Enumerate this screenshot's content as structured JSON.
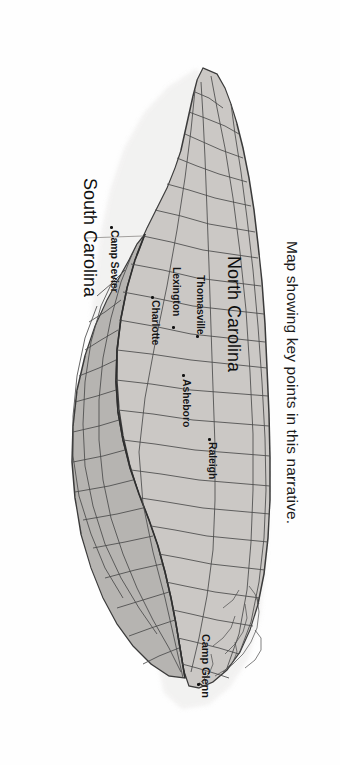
{
  "figure": {
    "caption": "Map showing key points in this narrative.",
    "orientation": "rotated-90-clockwise",
    "background_color": "#ffffff"
  },
  "map": {
    "title": "Map showing key points in this narrative.",
    "states": [
      {
        "name": "North Carolina",
        "label": "North Carolina",
        "fill_color": "#cbc8c5",
        "border_color": "#3a3a3a"
      },
      {
        "name": "South Carolina",
        "label": "South Carolina",
        "fill_color": "#b6b4b1",
        "border_color": "#3a3a3a"
      }
    ],
    "county_line_color": "#4a4a4a",
    "points": [
      {
        "label": "Camp Glenn",
        "marker": "dot",
        "state": "North Carolina"
      },
      {
        "label": "Raleigh",
        "marker": "dot",
        "state": "North Carolina"
      },
      {
        "label": "Asheboro",
        "marker": "dot",
        "state": "North Carolina"
      },
      {
        "label": "Thomasville",
        "marker": "dot",
        "state": "North Carolina"
      },
      {
        "label": "Lexington",
        "marker": "dot",
        "state": "North Carolina"
      },
      {
        "label": "Charlotte",
        "marker": "dot",
        "state": "North Carolina"
      },
      {
        "label": "Camp Sevier",
        "marker": "dot",
        "state": "South Carolina"
      }
    ]
  }
}
